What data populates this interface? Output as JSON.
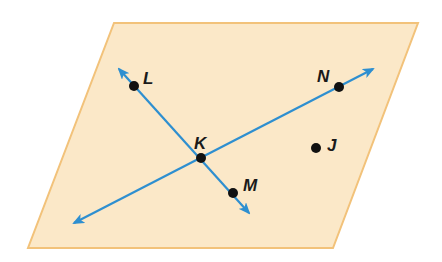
{
  "diagram": {
    "type": "geometry-plane",
    "colors": {
      "plane_fill": "#fbe8c8",
      "plane_edge": "#f2c27a",
      "line": "#2e8fd0",
      "point": "#111111",
      "label": "#1a1a1a"
    },
    "plane": {
      "vertices": [
        [
          114,
          23
        ],
        [
          418,
          23
        ],
        [
          333,
          248
        ],
        [
          28,
          248
        ]
      ]
    },
    "lines": [
      {
        "name": "line-LM",
        "from": [
          119,
          69
        ],
        "to": [
          249,
          213
        ],
        "through": [
          "L",
          "K",
          "M"
        ]
      },
      {
        "name": "line-NK",
        "from": [
          373,
          69
        ],
        "to": [
          74,
          223
        ],
        "through": [
          "N",
          "K"
        ]
      }
    ],
    "points": [
      {
        "id": "L",
        "label": "L",
        "x": 134,
        "y": 86,
        "label_x": 143,
        "label_y": 84
      },
      {
        "id": "N",
        "label": "N",
        "x": 339,
        "y": 87,
        "label_x": 317,
        "label_y": 82
      },
      {
        "id": "K",
        "label": "K",
        "x": 201,
        "y": 158,
        "label_x": 194,
        "label_y": 149
      },
      {
        "id": "M",
        "label": "M",
        "x": 233,
        "y": 193,
        "label_x": 243,
        "label_y": 191
      },
      {
        "id": "J",
        "label": "J",
        "x": 316,
        "y": 148,
        "label_x": 327,
        "label_y": 151
      }
    ]
  }
}
